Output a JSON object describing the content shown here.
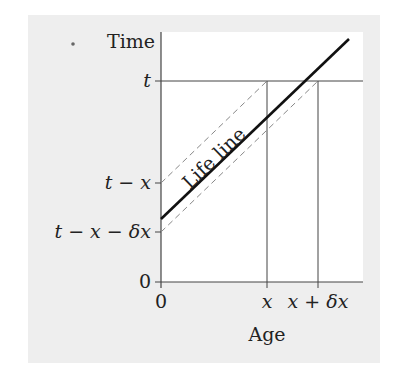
{
  "diagram": {
    "axes": {
      "y_label": "Time",
      "x_label": "Age",
      "y_ticks": [
        {
          "label": "t",
          "y": 81
        },
        {
          "label": "t − x",
          "y": 183
        },
        {
          "label": "t − x − δx",
          "y": 232
        },
        {
          "label": "0",
          "y": 282
        }
      ],
      "x_ticks": [
        {
          "label": "0",
          "x": 161
        },
        {
          "label": "x",
          "x": 267
        },
        {
          "label": "x + δx",
          "x": 318
        }
      ]
    },
    "lifeline": {
      "label": "Life line",
      "from": [
        161,
        219
      ],
      "to": [
        349,
        39
      ]
    },
    "dashed_lines": [
      {
        "from": [
          161,
          183
        ],
        "to": [
          267,
          81
        ]
      },
      {
        "from": [
          161,
          232
        ],
        "to": [
          318,
          81
        ]
      }
    ],
    "colors": {
      "background": "#eeeeee",
      "panel": "#ffffff",
      "axis": "#444444",
      "lifeline": "#111111",
      "dashed": "#888888"
    }
  }
}
